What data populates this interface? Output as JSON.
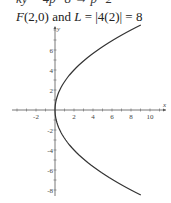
{
  "heading": {
    "cut_text": "ky = 4p=8 → p=2",
    "focus_label": "F",
    "focus_coords": "(2,0)",
    "connector": "and",
    "latus_label": "L",
    "latus_expr": "= |4(2)| = 8"
  },
  "chart_data": {
    "type": "line",
    "title": "",
    "equation": "y^2 = 8x",
    "xlabel": "x",
    "ylabel": "y",
    "xlim": [
      -3.5,
      11.5
    ],
    "ylim": [
      -8.5,
      8.5
    ],
    "x_ticks": [
      -2,
      2,
      4,
      6,
      8,
      10
    ],
    "y_ticks": [
      -8,
      -6,
      -4,
      -2,
      2,
      4,
      6,
      8
    ],
    "x_tick_labels": [
      "-2",
      "2",
      "4",
      "6",
      "8",
      "10"
    ],
    "y_tick_labels": [
      "-8",
      "-6",
      "-4",
      "-2",
      "2",
      "4",
      "6"
    ],
    "grid": false,
    "series": [
      {
        "name": "parabola",
        "x": [
          8.0,
          4.5,
          2.0,
          0.5,
          0.0,
          0.5,
          2.0,
          4.5,
          8.0
        ],
        "y": [
          -8,
          -6,
          -4,
          -2,
          0,
          2,
          4,
          6,
          8
        ]
      }
    ],
    "color": "#333333"
  }
}
